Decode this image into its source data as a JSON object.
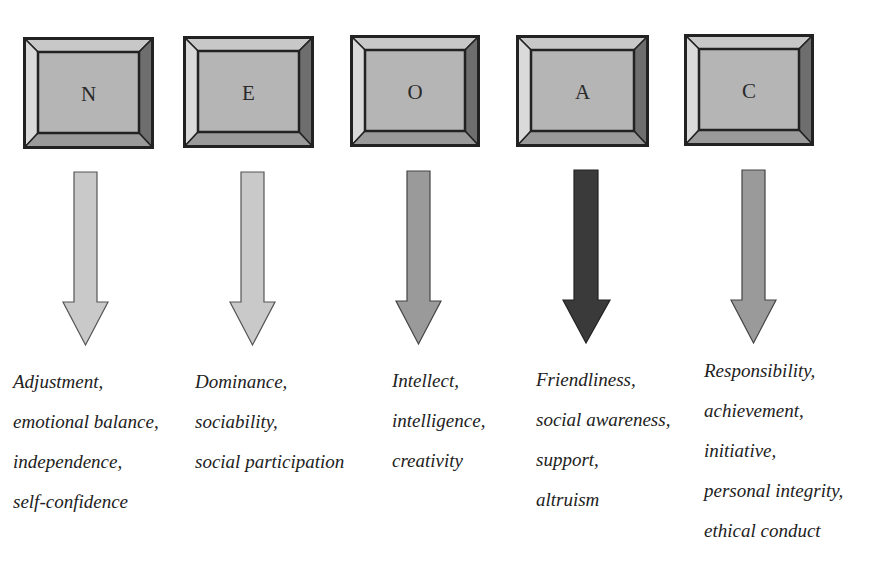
{
  "colors": {
    "bevel_top": "#c8c8c8",
    "bevel_left": "#d9d9d9",
    "bevel_right": "#6e6e6e",
    "bevel_bottom": "#9a9a9a",
    "face": "#b5b5b5",
    "outline": "#222222",
    "arrow_light": "#c9c9c9",
    "arrow_medium": "#9a9a9a",
    "arrow_dark": "#3a3a3a"
  },
  "factors": [
    {
      "letter": "N",
      "arrow_shade": "light",
      "traits": [
        "Adjustment,",
        "emotional balance,",
        "independence,",
        "self-confidence"
      ]
    },
    {
      "letter": "E",
      "arrow_shade": "light",
      "traits": [
        "Dominance,",
        "sociability,",
        "social participation"
      ]
    },
    {
      "letter": "O",
      "arrow_shade": "medium",
      "traits": [
        "Intellect,",
        "intelligence,",
        "creativity"
      ]
    },
    {
      "letter": "A",
      "arrow_shade": "dark",
      "traits": [
        "Friendliness,",
        "social awareness,",
        "support,",
        "altruism"
      ]
    },
    {
      "letter": "C",
      "arrow_shade": "medium",
      "traits": [
        "Responsibility,",
        "achievement,",
        "initiative,",
        "personal integrity,",
        "ethical conduct"
      ]
    }
  ]
}
